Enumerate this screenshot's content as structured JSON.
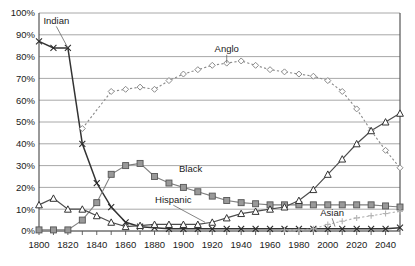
{
  "chart_data": {
    "type": "line",
    "title": "",
    "xlabel": "",
    "ylabel": "",
    "xlim": [
      1800,
      2050
    ],
    "ylim": [
      0,
      100
    ],
    "grid": true,
    "legend_position": "inline-annotations",
    "x_tick_step": 10,
    "x_label_step": 20,
    "y_tick_step": 10,
    "x": [
      1800,
      1810,
      1820,
      1830,
      1840,
      1850,
      1860,
      1870,
      1880,
      1890,
      1900,
      1910,
      1920,
      1930,
      1940,
      1950,
      1960,
      1970,
      1980,
      1990,
      2000,
      2010,
      2020,
      2030,
      2040,
      2050
    ],
    "xtick_labels": [
      "1800",
      "",
      "1820",
      "",
      "1840",
      "",
      "1860",
      "",
      "1880",
      "",
      "1900",
      "",
      "1920",
      "",
      "1940",
      "",
      "1960",
      "",
      "1980",
      "",
      "2000",
      "",
      "2020",
      "",
      "2040",
      ""
    ],
    "ytick_labels": [
      "0%",
      "10%",
      "20%",
      "30%",
      "40%",
      "50%",
      "60%",
      "70%",
      "80%",
      "90%",
      "100%"
    ],
    "ytick_values": [
      0,
      10,
      20,
      30,
      40,
      50,
      60,
      70,
      80,
      90,
      100
    ],
    "series": [
      {
        "name": "Indian",
        "label": "Indian",
        "marker": "x",
        "color": "#333333",
        "values": [
          87,
          84,
          84,
          40,
          22,
          11,
          4,
          2,
          1.5,
          1,
          1,
          1,
          1,
          1,
          1,
          1,
          1,
          1,
          1,
          1,
          1,
          1,
          1,
          1,
          1,
          1.5
        ]
      },
      {
        "name": "Anglo",
        "label": "Anglo",
        "marker": "diamond",
        "color": "#8a8a8a",
        "values": [
          null,
          null,
          null,
          47,
          null,
          64,
          65,
          66,
          65,
          69,
          72,
          74,
          76,
          77,
          78,
          76,
          74,
          73,
          72,
          71,
          69,
          64,
          56,
          46,
          37,
          29
        ]
      },
      {
        "name": "Black",
        "label": "Black",
        "marker": "square",
        "color": "#808080",
        "values": [
          0.5,
          0.5,
          0.5,
          5,
          13,
          26,
          30,
          31,
          25,
          22,
          20,
          18,
          16,
          14,
          13,
          12.5,
          12,
          12,
          12,
          12,
          12,
          12,
          12,
          12,
          11.5,
          11
        ]
      },
      {
        "name": "Hispanic",
        "label": "Hispanic",
        "marker": "triangle",
        "color": "#4d4d4d",
        "values": [
          12,
          15,
          10,
          10,
          7,
          4,
          2,
          2.5,
          3,
          3,
          3,
          3,
          4,
          6,
          8,
          9,
          10,
          11,
          14,
          19,
          26,
          33,
          40,
          46,
          50,
          54
        ]
      },
      {
        "name": "Asian",
        "label": "Asian",
        "marker": "plus",
        "color": "#b3b3b3",
        "values": [
          null,
          null,
          null,
          null,
          null,
          null,
          null,
          null,
          null,
          null,
          null,
          null,
          null,
          null,
          null,
          null,
          null,
          0.5,
          0.5,
          1,
          3,
          4.5,
          6,
          7,
          8,
          9
        ]
      }
    ],
    "annotations": [
      {
        "text": "Indian",
        "x": 1812,
        "y": 95,
        "leader_to_x": 1820,
        "leader_to_y": 84
      },
      {
        "text": "Anglo",
        "x": 1930,
        "y": 82,
        "leader_to_x": 1930,
        "leader_to_y": 77
      },
      {
        "text": "Black",
        "x": 1905,
        "y": 27,
        "leader_to_x": null,
        "leader_to_y": null
      },
      {
        "text": "Hispanic",
        "x": 1893,
        "y": 13,
        "leader_to_x": 1915,
        "leader_to_y": 4
      },
      {
        "text": "Asian",
        "x": 2003,
        "y": 7,
        "leader_to_x": 2005,
        "leader_to_y": 2
      }
    ]
  },
  "colors": {
    "background": "#ffffff",
    "grid": "#9e9e9e",
    "axis": "#555555",
    "text": "#1a1a1a"
  }
}
